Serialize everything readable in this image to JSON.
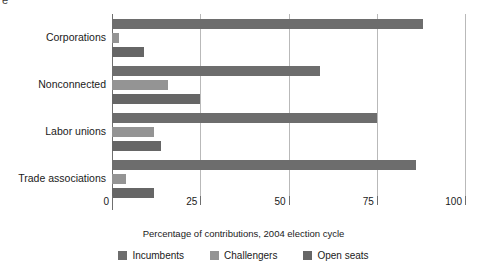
{
  "title_remnant": "e",
  "chart_data": {
    "type": "bar",
    "orientation": "horizontal",
    "title": "",
    "xlabel": "Percentage of contributions, 2004 election cycle",
    "ylabel": "",
    "xlim": [
      0,
      100
    ],
    "xticks": [
      0,
      25,
      50,
      75,
      100
    ],
    "xtick_labels": [
      "0",
      "25",
      "50",
      "75",
      "100"
    ],
    "grid": "vertical",
    "legend_position": "bottom-center",
    "categories": [
      "Corporations",
      "Nonconnected",
      "Labor unions",
      "Trade associations"
    ],
    "series": [
      {
        "name": "Incumbents",
        "color": "#6d6d6d",
        "values": [
          88,
          59,
          75,
          86
        ]
      },
      {
        "name": "Challengers",
        "color": "#949494",
        "values": [
          2,
          16,
          12,
          4
        ]
      },
      {
        "name": "Open seats",
        "color": "#666666",
        "values": [
          9,
          25,
          14,
          12
        ]
      }
    ]
  },
  "legend": {
    "items": [
      {
        "label": "Incumbents",
        "color": "#6d6d6d"
      },
      {
        "label": "Challengers",
        "color": "#949494"
      },
      {
        "label": "Open seats",
        "color": "#666666"
      }
    ]
  }
}
